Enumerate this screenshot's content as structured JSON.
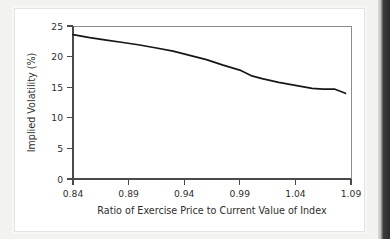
{
  "chart_data": {
    "type": "line",
    "title": "",
    "xlabel": "Ratio of Exercise Price to Current Value of Index",
    "ylabel": "Implied Volatility (%)",
    "xlim": [
      0.84,
      1.09
    ],
    "ylim": [
      0,
      25
    ],
    "grid": false,
    "legend": null,
    "xticks": [
      "0.84",
      "0.89",
      "0.94",
      "0.99",
      "1.04",
      "1.09"
    ],
    "xtick_values": [
      0.84,
      0.89,
      0.94,
      0.99,
      1.04,
      1.09
    ],
    "yticks": [
      "0",
      "5",
      "10",
      "15",
      "20",
      "25"
    ],
    "ytick_values": [
      0,
      5,
      10,
      15,
      20,
      25
    ],
    "series": [
      {
        "name": "Implied volatility",
        "color": "#17171a",
        "x": [
          0.84,
          0.855,
          0.87,
          0.885,
          0.9,
          0.915,
          0.93,
          0.945,
          0.96,
          0.975,
          0.99,
          1.0,
          1.01,
          1.025,
          1.04,
          1.055,
          1.065,
          1.075,
          1.085
        ],
        "y": [
          23.6,
          23.1,
          22.7,
          22.3,
          21.9,
          21.4,
          20.9,
          20.2,
          19.5,
          18.6,
          17.8,
          16.9,
          16.4,
          15.8,
          15.3,
          14.8,
          14.7,
          14.7,
          14.0
        ]
      }
    ]
  },
  "axes": {
    "y_title": "Implied Volatility (%)",
    "x_title": "Ratio of Exercise Price to Current Value of Index"
  },
  "colors": {
    "line": "#17171a",
    "axis": "#4a4a4a",
    "frame": "#8d8d8d",
    "page_background": "#f2f2f1",
    "card_background": "#ffffff"
  }
}
